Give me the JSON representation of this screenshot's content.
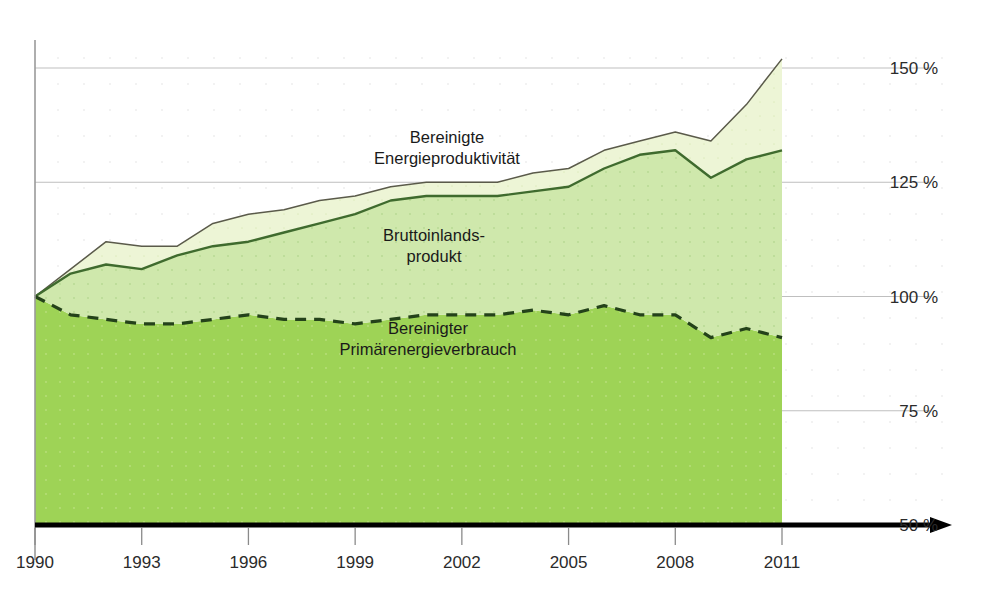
{
  "chart_data": {
    "type": "area",
    "title": "",
    "subtitle": "",
    "xlabel": "",
    "ylabel": "",
    "grid": true,
    "legend_position": "inline-annotations",
    "xlim": [
      1990,
      2011
    ],
    "ylim": [
      50,
      150
    ],
    "x": [
      1990,
      1991,
      1992,
      1993,
      1994,
      1995,
      1996,
      1997,
      1998,
      1999,
      2000,
      2001,
      2002,
      2003,
      2004,
      2005,
      2006,
      2007,
      2008,
      2009,
      2010,
      2011
    ],
    "x_ticks": [
      "1990",
      "1993",
      "1996",
      "1999",
      "2002",
      "2005",
      "2008",
      "2011"
    ],
    "x_tick_values": [
      1990,
      1993,
      1996,
      1999,
      2002,
      2005,
      2008,
      2011
    ],
    "y_ticks": [
      "150 %",
      "125 %",
      "100 %",
      "75 %",
      "50 %"
    ],
    "y_tick_values": [
      150,
      125,
      100,
      75,
      50
    ],
    "baseline": 50,
    "series": [
      {
        "name": "Bereinigte Energieproduktivität",
        "label_lines": [
          "Bereinigte",
          "Energieproduktivität"
        ],
        "style": "solid-thin",
        "color": "#5a5a4a",
        "fill": "#edf5d6",
        "values": [
          100,
          106,
          112,
          111,
          111,
          116,
          118,
          119,
          121,
          122,
          124,
          125,
          125,
          125,
          127,
          128,
          132,
          134,
          136,
          134,
          142,
          152
        ]
      },
      {
        "name": "Bruttoinlandsprodukt",
        "label_lines": [
          "Bruttoinlands-",
          "produkt"
        ],
        "style": "solid-thick",
        "color": "#3f6b2e",
        "fill": "#cfe8ac",
        "values": [
          100,
          105,
          107,
          106,
          109,
          111,
          112,
          114,
          116,
          118,
          121,
          122,
          122,
          122,
          123,
          124,
          128,
          131,
          132,
          126,
          130,
          132
        ]
      },
      {
        "name": "Bereinigter Primärenergieverbrauch",
        "label_lines": [
          "Bereinigter",
          "Primärenergieverbrauch"
        ],
        "style": "dashed",
        "color": "#24421a",
        "fill": "#9ed356",
        "values": [
          100,
          96,
          95,
          94,
          94,
          95,
          96,
          95,
          95,
          94,
          95,
          96,
          96,
          96,
          97,
          96,
          98,
          96,
          96,
          91,
          93,
          91
        ]
      }
    ],
    "colors": {
      "band_top": "#edf5d6",
      "band_middle": "#cfe8ac",
      "band_bottom": "#9ed356",
      "axis": "#000000",
      "gridline": "#bfbfbf",
      "text": "#1a1a1a"
    },
    "annotations": [
      {
        "text_lines": [
          "Bereinigte",
          "Energieproduktivität"
        ],
        "x": 447,
        "y": 143
      },
      {
        "text_lines": [
          "Bruttoinlands-",
          "produkt"
        ],
        "x": 434,
        "y": 241
      },
      {
        "text_lines": [
          "Bereinigter",
          "Primärenergieverbrauch"
        ],
        "x": 428,
        "y": 334
      }
    ]
  }
}
